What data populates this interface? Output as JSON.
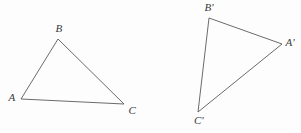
{
  "figure": {
    "background_color": "#fdfdfd",
    "stroke_color": "#5a5a5a",
    "label_color": "#3a3a3a",
    "stroke_width": 0.9,
    "width": 301,
    "height": 133
  },
  "diagram_data": {
    "type": "geometry-diagram",
    "description": "Two congruent triangles, the second a rotated image of the first",
    "shapes": [
      {
        "name": "triangle-abc",
        "vertices": [
          {
            "label": "A",
            "x": 21,
            "y": 99,
            "label_x": 12,
            "label_y": 97
          },
          {
            "label": "B",
            "x": 58,
            "y": 39,
            "label_x": 59,
            "label_y": 28
          },
          {
            "label": "C",
            "x": 124,
            "y": 104,
            "label_x": 132,
            "label_y": 110
          }
        ]
      },
      {
        "name": "triangle-a-prime-b-prime-c-prime",
        "vertices": [
          {
            "label": "A'",
            "x": 282,
            "y": 44,
            "label_x": 290,
            "label_y": 42
          },
          {
            "label": "B'",
            "x": 209,
            "y": 18,
            "label_x": 209,
            "label_y": 7
          },
          {
            "label": "C'",
            "x": 198,
            "y": 112,
            "label_x": 199,
            "label_y": 120
          }
        ]
      }
    ]
  },
  "labels": {
    "a": "A",
    "b": "B",
    "c": "C",
    "a_prime": "A'",
    "b_prime": "B'",
    "c_prime": "C'"
  }
}
